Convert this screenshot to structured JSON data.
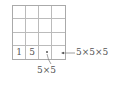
{
  "diagram": {
    "grid": {
      "rows": 4,
      "cols": 4
    },
    "bottom_row": [
      "1",
      "5",
      "",
      ""
    ],
    "labels": {
      "dot_label": "5×5",
      "arrow_label": "5×5×5"
    }
  }
}
